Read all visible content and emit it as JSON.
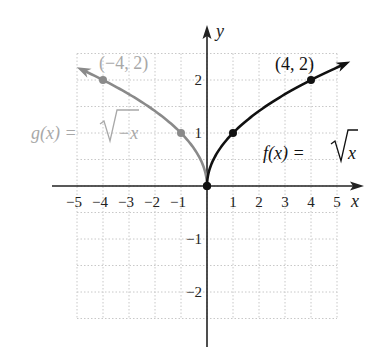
{
  "figure": {
    "type": "function-graph",
    "axes": {
      "x_label": "x",
      "y_label": "y",
      "x_ticks": [
        "−5",
        "−4",
        "−3",
        "−2",
        "−1",
        "1",
        "2",
        "3",
        "4",
        "5"
      ],
      "x_tick_values": [
        -5,
        -4,
        -3,
        -2,
        -1,
        1,
        2,
        3,
        4,
        5
      ],
      "y_ticks": [
        "2",
        "1",
        "−1",
        "−2"
      ],
      "y_tick_values": [
        2,
        1,
        -1,
        -2
      ]
    },
    "functions": [
      {
        "name": "f",
        "label_lhs": "f(x) = ",
        "label_radicand": "x",
        "formula": "f(x) = √x",
        "color": "#111111",
        "domain": [
          0,
          5.3
        ],
        "points": [
          {
            "x": 0,
            "y": 0
          },
          {
            "x": 1,
            "y": 1
          },
          {
            "x": 4,
            "y": 2
          }
        ],
        "annotated_point": {
          "label": "(4, 2)",
          "x": 4,
          "y": 2
        }
      },
      {
        "name": "g",
        "label_lhs": "g(x) = ",
        "label_radicand": "−x",
        "formula": "g(x) = √−x",
        "color": "#8a8a8a",
        "label_color": "#a8a8a8",
        "domain": [
          -4.8,
          0
        ],
        "points": [
          {
            "x": 0,
            "y": 0
          },
          {
            "x": -1,
            "y": 1
          },
          {
            "x": -4,
            "y": 2
          }
        ],
        "annotated_point": {
          "label": "(−4, 2)",
          "x": -4,
          "y": 2
        }
      }
    ],
    "grid": {
      "x_range": [
        -5,
        5
      ],
      "y_range": [
        -2.5,
        2.5
      ],
      "y_minor_step": 0.5,
      "style": "dotted",
      "color": "#c8c8c8"
    }
  }
}
